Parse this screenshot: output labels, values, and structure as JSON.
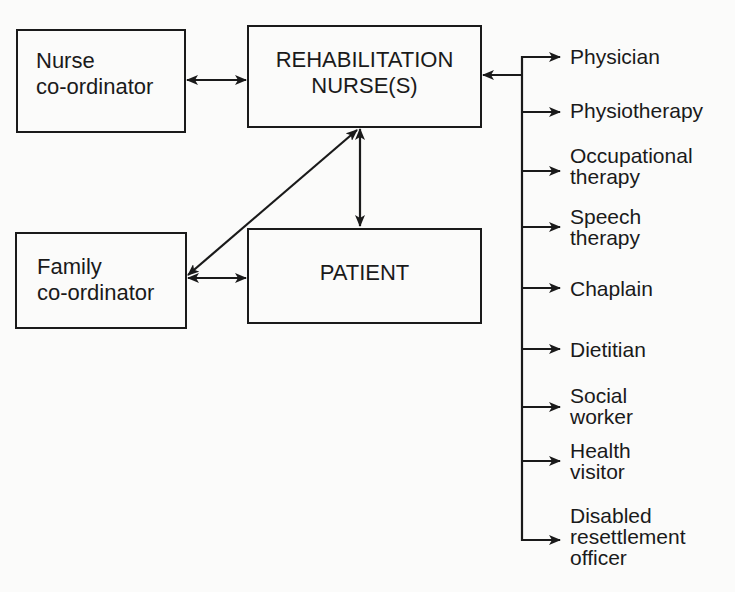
{
  "diagram": {
    "nodes": {
      "nurse_coordinator": {
        "line1": "Nurse",
        "line2": "co-ordinator"
      },
      "rehab_nurse": {
        "line1": "REHABILITATION",
        "line2": "NURSE(S)"
      },
      "family_coordinator": {
        "line1": "Family",
        "line2": "co-ordinator"
      },
      "patient": {
        "label": "PATIENT"
      }
    },
    "services": [
      {
        "line1": "Physician"
      },
      {
        "line1": "Physiotherapy"
      },
      {
        "line1": "Occupational",
        "line2": "therapy"
      },
      {
        "line1": "Speech",
        "line2": "therapy"
      },
      {
        "line1": "Chaplain"
      },
      {
        "line1": "Dietitian"
      },
      {
        "line1": "Social",
        "line2": "worker"
      },
      {
        "line1": "Health",
        "line2": "visitor"
      },
      {
        "line1": "Disabled",
        "line2": "resettlement",
        "line3": "officer"
      }
    ],
    "edges": [
      {
        "from": "nurse_coordinator",
        "to": "rehab_nurse",
        "type": "bidirectional"
      },
      {
        "from": "rehab_nurse",
        "to": "patient",
        "type": "bidirectional"
      },
      {
        "from": "rehab_nurse",
        "to": "family_coordinator",
        "type": "bidirectional"
      },
      {
        "from": "family_coordinator",
        "to": "patient",
        "type": "bidirectional"
      },
      {
        "from": "services_bus",
        "to": "rehab_nurse",
        "type": "directed"
      },
      {
        "from": "services_bus",
        "to": "services",
        "type": "directed"
      }
    ],
    "colors": {
      "ink": "#1a1a1a",
      "paper": "#fbfbfa"
    }
  }
}
